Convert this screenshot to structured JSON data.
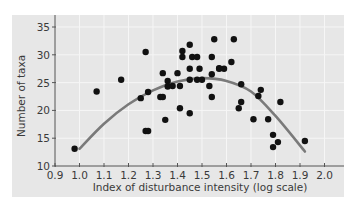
{
  "chart_data": {
    "type": "scatter",
    "title": "",
    "xlabel": "Index of disturbance intensity (log scale)",
    "ylabel": "Number of taxa",
    "xlim": [
      0.9,
      2.08
    ],
    "ylim": [
      10,
      36
    ],
    "xticks": [
      0.9,
      1.0,
      1.1,
      1.2,
      1.3,
      1.4,
      1.5,
      1.6,
      1.7,
      1.8,
      1.9,
      2.0
    ],
    "xtick_labels": [
      "0.9",
      "1.0",
      "1.1",
      "1.2",
      "1.3",
      "1.4",
      "1.5",
      "1.6",
      "1.7",
      "1.8",
      "1.9",
      "2.0"
    ],
    "yticks": [
      10,
      15,
      20,
      25,
      30,
      35
    ],
    "ytick_labels": [
      "10",
      "15",
      "20",
      "25",
      "30",
      "35"
    ],
    "grid": true,
    "legend": null,
    "colors": {
      "panel_background": "#e7e7e7",
      "grid": "#f6f6f6",
      "axis": "#555555",
      "points": "#111111",
      "fit_curve": "#7a7a7a"
    },
    "series": [
      {
        "name": "observations",
        "kind": "scatter",
        "points": [
          [
            0.98,
            13.1
          ],
          [
            1.07,
            23.4
          ],
          [
            1.17,
            25.5
          ],
          [
            1.25,
            22.2
          ],
          [
            1.27,
            30.5
          ],
          [
            1.28,
            23.3
          ],
          [
            1.27,
            16.3
          ],
          [
            1.28,
            16.3
          ],
          [
            1.33,
            22.4
          ],
          [
            1.34,
            22.4
          ],
          [
            1.34,
            26.7
          ],
          [
            1.35,
            18.3
          ],
          [
            1.36,
            25.3
          ],
          [
            1.36,
            24.3
          ],
          [
            1.38,
            24.4
          ],
          [
            1.4,
            26.7
          ],
          [
            1.41,
            24.4
          ],
          [
            1.41,
            20.4
          ],
          [
            1.42,
            30.7
          ],
          [
            1.42,
            29.6
          ],
          [
            1.45,
            31.8
          ],
          [
            1.45,
            27.5
          ],
          [
            1.45,
            25.5
          ],
          [
            1.45,
            19.5
          ],
          [
            1.46,
            29.6
          ],
          [
            1.48,
            29.6
          ],
          [
            1.48,
            25.5
          ],
          [
            1.49,
            27.5
          ],
          [
            1.5,
            25.5
          ],
          [
            1.53,
            24.4
          ],
          [
            1.54,
            29.6
          ],
          [
            1.54,
            26.5
          ],
          [
            1.54,
            22.4
          ],
          [
            1.55,
            32.8
          ],
          [
            1.57,
            27.6
          ],
          [
            1.57,
            27.5
          ],
          [
            1.59,
            27.5
          ],
          [
            1.62,
            28.7
          ],
          [
            1.63,
            32.8
          ],
          [
            1.66,
            24.7
          ],
          [
            1.66,
            21.5
          ],
          [
            1.65,
            20.4
          ],
          [
            1.71,
            18.4
          ],
          [
            1.73,
            22.6
          ],
          [
            1.74,
            23.7
          ],
          [
            1.77,
            18.4
          ],
          [
            1.79,
            15.6
          ],
          [
            1.81,
            14.3
          ],
          [
            1.79,
            13.4
          ],
          [
            1.82,
            21.5
          ],
          [
            1.92,
            14.5
          ]
        ]
      },
      {
        "name": "quadratic fit",
        "kind": "line",
        "points": [
          [
            1.0,
            13.1
          ],
          [
            1.1,
            17.6
          ],
          [
            1.2,
            21.1
          ],
          [
            1.3,
            23.6
          ],
          [
            1.4,
            25.2
          ],
          [
            1.5,
            25.8
          ],
          [
            1.6,
            25.3
          ],
          [
            1.7,
            23.4
          ],
          [
            1.8,
            19.0
          ],
          [
            1.92,
            12.6
          ]
        ]
      }
    ]
  }
}
